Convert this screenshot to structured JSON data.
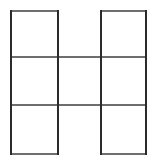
{
  "figure": {
    "type": "line-drawing",
    "background_color": "#ffffff",
    "canvas": {
      "width": 160,
      "height": 166
    },
    "grid": {
      "columns": 3,
      "rows": 3,
      "cell_width": 47,
      "cell_height": 48,
      "x_lines": [
        10,
        57.5,
        101,
        147
      ],
      "y_lines": [
        10,
        57,
        105,
        155
      ],
      "occupied_cells": [
        {
          "col": 0,
          "row": 0
        },
        {
          "col": 2,
          "row": 0
        },
        {
          "col": 0,
          "row": 1
        },
        {
          "col": 1,
          "row": 1
        },
        {
          "col": 2,
          "row": 1
        },
        {
          "col": 0,
          "row": 2
        },
        {
          "col": 2,
          "row": 2
        }
      ],
      "empty_cells": [
        {
          "col": 1,
          "row": 0
        },
        {
          "col": 1,
          "row": 2
        }
      ],
      "cell_count": 7
    },
    "stroke": {
      "vertical_color": "#2b2b2b",
      "horizontal_color": "#6e6e6e",
      "width": 2
    },
    "segments": {
      "vertical": [
        {
          "name": "left-outer-edge",
          "x": 11,
          "y1": 10,
          "y2": 155
        },
        {
          "name": "left-inner-edge",
          "x": 57.5,
          "y1": 10,
          "y2": 155
        },
        {
          "name": "right-inner-edge",
          "x": 101,
          "y1": 10,
          "y2": 155
        },
        {
          "name": "right-outer-edge",
          "x": 146,
          "y1": 10,
          "y2": 155
        }
      ],
      "horizontal": [
        {
          "name": "top-edge-left-cell",
          "y": 11,
          "x1": 10,
          "x2": 58
        },
        {
          "name": "top-edge-right-cell",
          "y": 11,
          "x1": 101,
          "x2": 147
        },
        {
          "name": "upper-divider-full",
          "y": 57,
          "x1": 10,
          "x2": 147
        },
        {
          "name": "lower-divider-full",
          "y": 105,
          "x1": 10,
          "x2": 147
        },
        {
          "name": "bottom-edge-left-cell",
          "y": 154,
          "x1": 10,
          "x2": 58
        },
        {
          "name": "bottom-edge-right-cell",
          "y": 154,
          "x1": 101,
          "x2": 147
        }
      ]
    }
  }
}
